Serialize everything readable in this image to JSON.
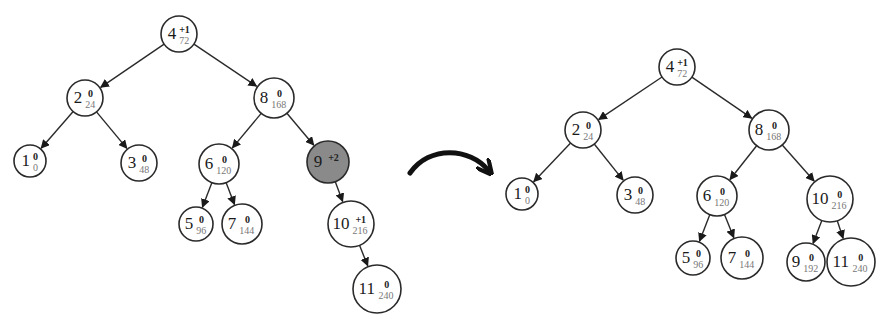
{
  "diagram": {
    "title": "",
    "transition_arrow": "curved-right-arrow",
    "trees": [
      {
        "name": "before",
        "nodes": [
          {
            "id": "L4",
            "key": "4",
            "balance": "+1",
            "value": "72",
            "x": 179,
            "y": 34,
            "r": 18,
            "highlight": false
          },
          {
            "id": "L2",
            "key": "2",
            "balance": "0",
            "value": "24",
            "x": 85,
            "y": 98,
            "r": 18,
            "highlight": false
          },
          {
            "id": "L8",
            "key": "8",
            "balance": "0",
            "value": "168",
            "x": 274,
            "y": 98,
            "r": 20,
            "highlight": false
          },
          {
            "id": "L1",
            "key": "1",
            "balance": "0",
            "value": "0",
            "x": 30,
            "y": 161,
            "r": 16,
            "highlight": false
          },
          {
            "id": "L3",
            "key": "3",
            "balance": "0",
            "value": "48",
            "x": 139,
            "y": 163,
            "r": 18,
            "highlight": false
          },
          {
            "id": "L6",
            "key": "6",
            "balance": "0",
            "value": "120",
            "x": 219,
            "y": 164,
            "r": 20,
            "highlight": false
          },
          {
            "id": "L9",
            "key": "9",
            "balance": "+2",
            "value": "192",
            "x": 328,
            "y": 162,
            "r": 21,
            "highlight": true
          },
          {
            "id": "L5",
            "key": "5",
            "balance": "0",
            "value": "96",
            "x": 196,
            "y": 224,
            "r": 17,
            "highlight": false
          },
          {
            "id": "L7",
            "key": "7",
            "balance": "0",
            "value": "144",
            "x": 242,
            "y": 224,
            "r": 20,
            "highlight": false
          },
          {
            "id": "L10",
            "key": "10",
            "balance": "+1",
            "value": "216",
            "x": 351,
            "y": 224,
            "r": 23,
            "highlight": false
          },
          {
            "id": "L11",
            "key": "11",
            "balance": "0",
            "value": "240",
            "x": 377,
            "y": 289,
            "r": 24,
            "highlight": false
          }
        ],
        "edges": [
          [
            "L4",
            "L2"
          ],
          [
            "L4",
            "L8"
          ],
          [
            "L2",
            "L1"
          ],
          [
            "L2",
            "L3"
          ],
          [
            "L8",
            "L6"
          ],
          [
            "L8",
            "L9"
          ],
          [
            "L6",
            "L5"
          ],
          [
            "L6",
            "L7"
          ],
          [
            "L9",
            "L10"
          ],
          [
            "L10",
            "L11"
          ]
        ]
      },
      {
        "name": "after",
        "nodes": [
          {
            "id": "R4",
            "key": "4",
            "balance": "+1",
            "value": "72",
            "x": 677,
            "y": 67,
            "r": 18,
            "highlight": false
          },
          {
            "id": "R2",
            "key": "2",
            "balance": "0",
            "value": "24",
            "x": 583,
            "y": 130,
            "r": 18,
            "highlight": false
          },
          {
            "id": "R8",
            "key": "8",
            "balance": "0",
            "value": "168",
            "x": 769,
            "y": 130,
            "r": 20,
            "highlight": false
          },
          {
            "id": "R1",
            "key": "1",
            "balance": "0",
            "value": "0",
            "x": 522,
            "y": 194,
            "r": 16,
            "highlight": false
          },
          {
            "id": "R3",
            "key": "3",
            "balance": "0",
            "value": "48",
            "x": 635,
            "y": 195,
            "r": 18,
            "highlight": false
          },
          {
            "id": "R6",
            "key": "6",
            "balance": "0",
            "value": "120",
            "x": 717,
            "y": 196,
            "r": 20,
            "highlight": false
          },
          {
            "id": "R10",
            "key": "10",
            "balance": "0",
            "value": "216",
            "x": 830,
            "y": 199,
            "r": 23,
            "highlight": false
          },
          {
            "id": "R5",
            "key": "5",
            "balance": "0",
            "value": "96",
            "x": 693,
            "y": 258,
            "r": 17,
            "highlight": false
          },
          {
            "id": "R7",
            "key": "7",
            "balance": "0",
            "value": "144",
            "x": 742,
            "y": 258,
            "r": 21,
            "highlight": false
          },
          {
            "id": "R9",
            "key": "9",
            "balance": "0",
            "value": "192",
            "x": 806,
            "y": 262,
            "r": 19,
            "highlight": false
          },
          {
            "id": "R11",
            "key": "11",
            "balance": "0",
            "value": "240",
            "x": 851,
            "y": 262,
            "r": 24,
            "highlight": false
          }
        ],
        "edges": [
          [
            "R4",
            "R2"
          ],
          [
            "R4",
            "R8"
          ],
          [
            "R2",
            "R1"
          ],
          [
            "R2",
            "R3"
          ],
          [
            "R8",
            "R6"
          ],
          [
            "R8",
            "R10"
          ],
          [
            "R6",
            "R5"
          ],
          [
            "R6",
            "R7"
          ],
          [
            "R10",
            "R9"
          ],
          [
            "R10",
            "R11"
          ]
        ]
      }
    ],
    "colors": {
      "stroke": "#2a2a2a",
      "highlight_fill": "#8a8a8a",
      "value_text": "#777777"
    }
  }
}
